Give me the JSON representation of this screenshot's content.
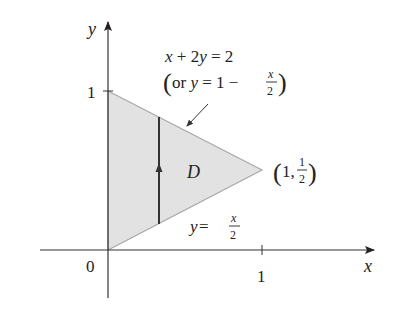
{
  "figure": {
    "axes": {
      "x_label": "x",
      "y_label": "y",
      "origin_label": "0",
      "x_tick_label": "1",
      "y_tick_label": "1"
    },
    "region": {
      "label": "D",
      "vertices": [
        [
          0,
          0
        ],
        [
          0,
          1
        ],
        [
          1,
          0.5
        ]
      ],
      "fill": "#e2e2e2",
      "edge": "#a8a8a8"
    },
    "upper_boundary": {
      "equation": "x + 2y = 2",
      "alt_prefix": "(or ",
      "alt_y": "y",
      "alt_eq": " = 1 − ",
      "frac_num": "x",
      "frac_den": "2",
      "alt_suffix": ")"
    },
    "lower_boundary": {
      "y": "y",
      "eq": " = ",
      "frac_num": "x",
      "frac_den": "2"
    },
    "vertex_label": {
      "open": "(",
      "x": "1, ",
      "frac_num": "1",
      "frac_den": "2",
      "close": ")"
    }
  }
}
